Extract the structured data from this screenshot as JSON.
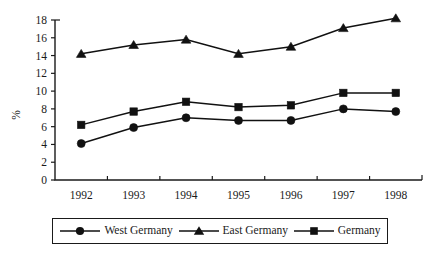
{
  "chart_data": {
    "type": "line",
    "title": "",
    "xlabel": "",
    "ylabel": "%",
    "categories": [
      "1992",
      "1993",
      "1994",
      "1995",
      "1996",
      "1997",
      "1998"
    ],
    "ylim": [
      0,
      18
    ],
    "ytick_step": 2,
    "yticks": [
      "0",
      "2",
      "4",
      "6",
      "8",
      "10",
      "12",
      "14",
      "16",
      "18"
    ],
    "grid": false,
    "legend_position": "bottom",
    "series": [
      {
        "name": "West Germany",
        "marker": "circle",
        "color": "#111111",
        "values": [
          4.1,
          5.9,
          7.0,
          6.7,
          6.7,
          8.0,
          7.7
        ]
      },
      {
        "name": "East Germany",
        "marker": "triangle",
        "color": "#111111",
        "values": [
          14.2,
          15.2,
          15.8,
          14.2,
          15.0,
          17.1,
          18.2
        ]
      },
      {
        "name": "Germany",
        "marker": "square",
        "color": "#111111",
        "values": [
          6.2,
          7.7,
          8.8,
          8.2,
          8.4,
          9.8,
          9.8
        ]
      }
    ]
  },
  "legend": {
    "items": [
      {
        "label": "West Germany",
        "marker": "circle"
      },
      {
        "label": "East Germany",
        "marker": "triangle"
      },
      {
        "label": "Germany",
        "marker": "square"
      }
    ]
  }
}
